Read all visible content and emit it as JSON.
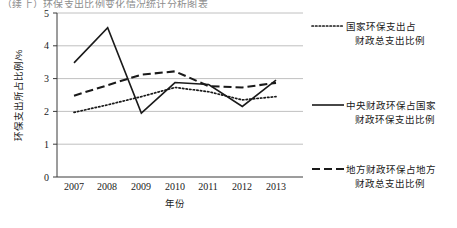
{
  "top_fragment": "（续上）环保支出比例变化情况统计分析图表",
  "chart_data": {
    "type": "line",
    "title": "",
    "xlabel": "年份",
    "ylabel": "环保支出所占比例/%",
    "categories": [
      "2007",
      "2008",
      "2009",
      "2010",
      "2011",
      "2012",
      "2013"
    ],
    "x": [
      2007,
      2008,
      2009,
      2010,
      2011,
      2012,
      2013
    ],
    "ylim": [
      0,
      5
    ],
    "yticks": [
      "0",
      "1",
      "2",
      "3",
      "4",
      "5"
    ],
    "ytick_values": [
      0,
      1,
      2,
      3,
      4,
      5
    ],
    "grid": "horizontal",
    "legend_position": "right",
    "series": [
      {
        "name": "国家环保支出占财政总支出比例",
        "style": "dotted",
        "color": "#1a1a1a",
        "values": [
          1.97,
          2.2,
          2.45,
          2.73,
          2.6,
          2.35,
          2.45
        ]
      },
      {
        "name": "中央财政环保占国家财政环保支出比例",
        "style": "solid",
        "color": "#1a1a1a",
        "values": [
          3.48,
          4.55,
          1.95,
          2.88,
          2.82,
          2.15,
          2.95
        ]
      },
      {
        "name": "地方财政环保占地方财政总支出比例",
        "style": "dashed",
        "color": "#1a1a1a",
        "values": [
          2.48,
          2.8,
          3.12,
          3.22,
          2.77,
          2.73,
          2.87
        ]
      }
    ]
  },
  "legend": {
    "items": [
      {
        "label_line1": "国家环保支出占",
        "label_line2": "财政总支出比例",
        "style": "dotted"
      },
      {
        "label_line1": "中央财政环保占国家",
        "label_line2": "财政环保支出比例",
        "style": "solid"
      },
      {
        "label_line1": "地方财政环保占地方",
        "label_line2": "财政总支出比例",
        "style": "dashed"
      }
    ]
  },
  "axes": {
    "y_title": "环保支出所占比例/%",
    "x_title": "年份",
    "y_ticks": [
      "5",
      "4",
      "3",
      "2",
      "1",
      "0"
    ],
    "x_ticks": [
      "2007",
      "2008",
      "2009",
      "2010",
      "2011",
      "2012",
      "2013"
    ]
  }
}
